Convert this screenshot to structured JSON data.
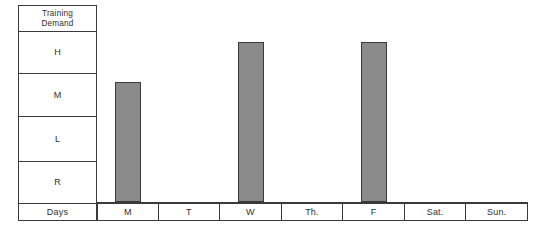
{
  "chart_data": {
    "type": "bar",
    "title": "",
    "xlabel": "Days",
    "ylabel": "Training Demand",
    "categories": [
      "M",
      "T",
      "W",
      "Th.",
      "F",
      "Sat.",
      "Sun."
    ],
    "y_tick_labels": [
      "H",
      "M",
      "L",
      "R"
    ],
    "y_levels_bottom_to_top": [
      "R",
      "L",
      "M",
      "H"
    ],
    "values": [
      "M",
      "",
      "H",
      "",
      "H",
      "",
      ""
    ],
    "numeric_values": [
      3,
      0,
      4,
      0,
      4,
      0,
      0
    ],
    "ylim": [
      0,
      4
    ],
    "grid": false,
    "legend": false,
    "bar_color": "#8a8a8a",
    "bar_border_color": "#3a3a3a",
    "series": [
      {
        "name": "Training Demand",
        "values": [
          3,
          0,
          4,
          0,
          4,
          0,
          0
        ]
      }
    ]
  },
  "axis": {
    "header_label": "Training\nDemand",
    "header_line1": "Training",
    "header_line2": "Demand",
    "levels": [
      {
        "key": "h",
        "label": "H"
      },
      {
        "key": "m",
        "label": "M"
      },
      {
        "key": "l",
        "label": "L"
      },
      {
        "key": "r",
        "label": "R"
      }
    ],
    "days_row_label": "Days"
  },
  "days": [
    {
      "key": "mon",
      "label": "M"
    },
    {
      "key": "tue",
      "label": "T"
    },
    {
      "key": "wed",
      "label": "W"
    },
    {
      "key": "thu",
      "label": "Th."
    },
    {
      "key": "fri",
      "label": "F"
    },
    {
      "key": "sat",
      "label": "Sat."
    },
    {
      "key": "sun",
      "label": "Sun."
    }
  ],
  "bars": [
    {
      "day": "M",
      "level": "M",
      "left": 17,
      "width": 26,
      "height": 116
    },
    {
      "day": "W",
      "level": "H",
      "left": 143,
      "width": 26,
      "height": 160
    },
    {
      "day": "F",
      "level": "H",
      "left": 270,
      "width": 26,
      "height": 160
    }
  ],
  "colors": {
    "bar_fill": "#8a8a8a",
    "line": "#3a3a3a",
    "text": "#2f2f2f",
    "background": "#ffffff"
  }
}
